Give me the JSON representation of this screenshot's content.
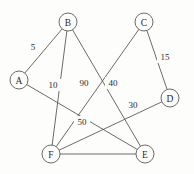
{
  "diagram": {
    "type": "node-link-graph",
    "width": 194,
    "height": 174,
    "background_color": "#fdfdfc",
    "stroke_color": "#5a5a58",
    "text_color": "#2b2b2a",
    "nodes": [
      {
        "id": "A",
        "label": "A",
        "x": 19,
        "y": 80,
        "r": 9
      },
      {
        "id": "B",
        "label": "B",
        "x": 68,
        "y": 22,
        "r": 9
      },
      {
        "id": "C",
        "label": "C",
        "x": 144,
        "y": 22,
        "r": 9
      },
      {
        "id": "D",
        "label": "D",
        "x": 170,
        "y": 98,
        "r": 9
      },
      {
        "id": "E",
        "label": "E",
        "x": 145,
        "y": 154,
        "r": 9
      },
      {
        "id": "F",
        "label": "F",
        "x": 51,
        "y": 154,
        "r": 9
      }
    ],
    "edges": [
      {
        "id": "A-B",
        "source": "A",
        "target": "B",
        "weight": "5",
        "label_x": 33,
        "label_y": 47
      },
      {
        "id": "B-F",
        "source": "B",
        "target": "F",
        "weight": "10",
        "label_x": 53,
        "label_y": 85
      },
      {
        "id": "B-E",
        "source": "B",
        "target": "E",
        "weight": "40",
        "label_x": 113,
        "label_y": 83
      },
      {
        "id": "C-F",
        "source": "C",
        "target": "F",
        "weight": "90",
        "label_x": 84,
        "label_y": 83
      },
      {
        "id": "C-D",
        "source": "C",
        "target": "D",
        "weight": "15",
        "label_x": 165,
        "label_y": 57
      },
      {
        "id": "D-F",
        "source": "D",
        "target": "F",
        "weight": "30",
        "label_x": 133,
        "label_y": 105
      },
      {
        "id": "F-E",
        "source": "F",
        "target": "E",
        "weight": "50",
        "label_x": 82,
        "label_y": 122
      },
      {
        "id": "A-E",
        "source": "A",
        "target": "E",
        "weight": "",
        "label_x": 0,
        "label_y": 0
      }
    ]
  }
}
